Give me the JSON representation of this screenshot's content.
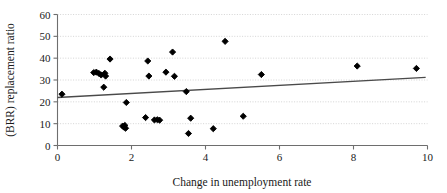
{
  "chart_data": {
    "type": "scatter",
    "title": "",
    "xlabel": "Change in unemployment rate",
    "ylabel": "(BRR) replacement ratio",
    "xlim": [
      0,
      10
    ],
    "ylim": [
      0,
      60
    ],
    "xticks": [
      "0",
      "2",
      "4",
      "6",
      "8",
      "10"
    ],
    "xtick_values": [
      0,
      2,
      4,
      6,
      8,
      10
    ],
    "yticks": [
      "0",
      "10",
      "20",
      "30",
      "40",
      "50",
      "60"
    ],
    "ytick_values": [
      0,
      10,
      20,
      30,
      40,
      50,
      60
    ],
    "grid": "horizontal-dotted",
    "legend": "none",
    "marker": "filled-diamond",
    "marker_color": "#000000",
    "points": [
      {
        "x": 0.12,
        "y": 23.5
      },
      {
        "x": 0.98,
        "y": 33.4
      },
      {
        "x": 1.05,
        "y": 33.6
      },
      {
        "x": 1.12,
        "y": 33.0
      },
      {
        "x": 1.18,
        "y": 32.3
      },
      {
        "x": 1.25,
        "y": 26.7
      },
      {
        "x": 1.28,
        "y": 33.1
      },
      {
        "x": 1.3,
        "y": 31.8
      },
      {
        "x": 1.42,
        "y": 39.6
      },
      {
        "x": 1.76,
        "y": 8.9
      },
      {
        "x": 1.8,
        "y": 8.4
      },
      {
        "x": 1.82,
        "y": 9.2
      },
      {
        "x": 1.84,
        "y": 7.9
      },
      {
        "x": 1.86,
        "y": 19.7
      },
      {
        "x": 2.38,
        "y": 12.8
      },
      {
        "x": 2.44,
        "y": 38.7
      },
      {
        "x": 2.47,
        "y": 31.8
      },
      {
        "x": 2.62,
        "y": 11.7
      },
      {
        "x": 2.7,
        "y": 11.8
      },
      {
        "x": 2.76,
        "y": 11.6
      },
      {
        "x": 2.93,
        "y": 33.6
      },
      {
        "x": 3.11,
        "y": 42.8
      },
      {
        "x": 3.16,
        "y": 31.7
      },
      {
        "x": 3.48,
        "y": 24.7
      },
      {
        "x": 3.54,
        "y": 5.5
      },
      {
        "x": 3.6,
        "y": 12.5
      },
      {
        "x": 4.21,
        "y": 7.7
      },
      {
        "x": 4.53,
        "y": 47.7
      },
      {
        "x": 5.02,
        "y": 13.4
      },
      {
        "x": 5.51,
        "y": 32.5
      },
      {
        "x": 8.1,
        "y": 36.4
      },
      {
        "x": 9.7,
        "y": 35.3
      }
    ],
    "trendline": {
      "type": "linear",
      "x_start": 0.0,
      "y_start": 22.0,
      "x_end": 9.95,
      "y_end": 31.2,
      "color": "#4a4a4a"
    }
  },
  "axes": {
    "axis_color": "#6e6e6e",
    "grid_color": "#c9c9c9"
  }
}
